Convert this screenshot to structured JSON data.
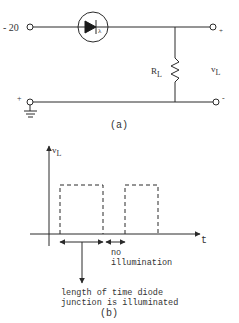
{
  "circuit": {
    "input_label": "- 20",
    "plus_left": "+",
    "plus_right": "+",
    "minus_right": "-",
    "resistor_label": "R",
    "resistor_subscript": "L",
    "output_label": "v",
    "output_subscript": "L",
    "diode_light_symbol": "λ",
    "caption": "(a)"
  },
  "waveform": {
    "y_axis_label": "v",
    "y_axis_subscript": "L",
    "x_axis_label": "t",
    "no_illumination_line1": "no",
    "no_illumination_line2": "illumination",
    "illuminated_line1": "length of time diode",
    "illuminated_line2": "junction is illuminated",
    "caption": "(b)"
  },
  "colors": {
    "line": "#2a2a2a",
    "text": "#333333"
  }
}
